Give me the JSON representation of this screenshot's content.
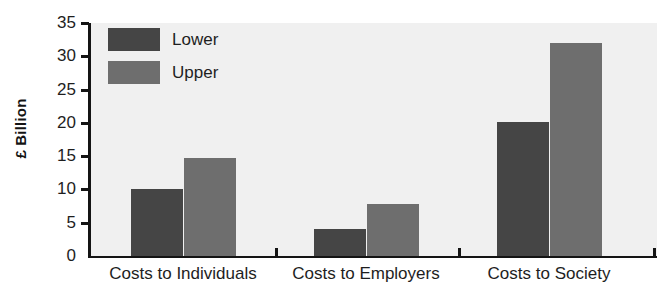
{
  "chart_data": {
    "type": "bar",
    "title": "",
    "xlabel": "",
    "ylabel": "£ Billion",
    "categories": [
      "Costs to Individuals",
      "Costs to Employers",
      "Costs to Society"
    ],
    "series": [
      {
        "name": "Lower",
        "values": [
          10.0,
          4.0,
          20.2
        ],
        "color": "#454545"
      },
      {
        "name": "Upper",
        "values": [
          14.7,
          7.8,
          32.0
        ],
        "color": "#6e6e6e"
      }
    ],
    "ylim": [
      0,
      35
    ],
    "yticks": [
      0,
      5,
      10,
      15,
      20,
      25,
      30,
      35
    ],
    "ytick_labels": [
      "0",
      "5",
      "10",
      "15",
      "20",
      "25",
      "30",
      "35"
    ],
    "grid": false,
    "legend_position": "top-left",
    "plot_background": "#f0f0f0",
    "axis_color": "#141414"
  },
  "legend": {
    "entries": [
      {
        "label": "Lower"
      },
      {
        "label": "Upper"
      }
    ]
  }
}
